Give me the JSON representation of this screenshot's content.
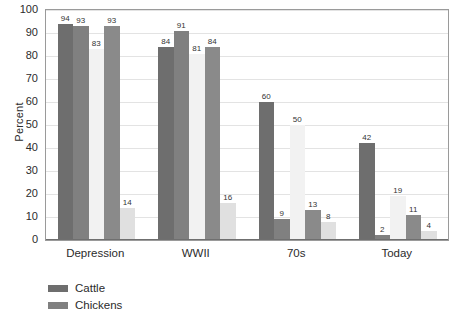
{
  "chart_data": {
    "type": "bar",
    "title": "",
    "xlabel": "",
    "ylabel": "Percent",
    "ylim": [
      0,
      100
    ],
    "ytick_step": 10,
    "yticks": [
      100,
      90,
      80,
      70,
      60,
      50,
      40,
      30,
      20,
      10,
      0
    ],
    "grid": true,
    "grid_axis": "y",
    "legend_position": "bottom-left",
    "categories": [
      "Depression",
      "WWII",
      "70s",
      "Today"
    ],
    "series": [
      {
        "name": "Cattle",
        "color": "#6e6e6e",
        "values": [
          94,
          84,
          60,
          42
        ]
      },
      {
        "name": "Chickens",
        "color": "#808080",
        "values": [
          93,
          91,
          9,
          2
        ]
      },
      {
        "name": "",
        "color": "#f2f2f2",
        "values": [
          83,
          81,
          50,
          19
        ]
      },
      {
        "name": "",
        "color": "#8a8a8a",
        "values": [
          93,
          84,
          13,
          11
        ]
      },
      {
        "name": "",
        "color": "#e0e0e0",
        "values": [
          14,
          16,
          8,
          4
        ]
      }
    ],
    "legend_entries": [
      {
        "label": "Cattle",
        "color": "#6e6e6e"
      },
      {
        "label": "Chickens",
        "color": "#808080"
      }
    ],
    "bar_value_labels": true
  }
}
